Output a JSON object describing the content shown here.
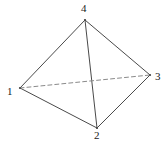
{
  "figure": {
    "kind": "tetrahedron-graph-diagram",
    "background_color": "#ffffff",
    "edge_color": "#4a4a4a",
    "hidden_edge_color": "#8a8a8a",
    "label_color": "#1a1a1a",
    "edge_width": 1,
    "dash_pattern": "4 3",
    "vertices": [
      {
        "id": "1",
        "label": "1",
        "x": 20,
        "y": 88,
        "label_x": 7,
        "label_y": 86
      },
      {
        "id": "2",
        "label": "2",
        "x": 97,
        "y": 128,
        "label_x": 94,
        "label_y": 130
      },
      {
        "id": "3",
        "label": "3",
        "x": 150,
        "y": 75,
        "label_x": 155,
        "label_y": 71
      },
      {
        "id": "4",
        "label": "4",
        "x": 85,
        "y": 20,
        "label_x": 81,
        "label_y": 3
      }
    ],
    "edges": [
      {
        "id": "edge-1-4",
        "from": "1",
        "to": "4",
        "style": "solid",
        "x1": 20,
        "y1": 88,
        "x2": 85,
        "y2": 20
      },
      {
        "id": "edge-3-4",
        "from": "3",
        "to": "4",
        "style": "solid",
        "x1": 150,
        "y1": 75,
        "x2": 85,
        "y2": 20
      },
      {
        "id": "edge-2-4",
        "from": "2",
        "to": "4",
        "style": "solid",
        "x1": 97,
        "y1": 128,
        "x2": 85,
        "y2": 20
      },
      {
        "id": "edge-1-2",
        "from": "1",
        "to": "2",
        "style": "solid",
        "x1": 20,
        "y1": 88,
        "x2": 97,
        "y2": 128
      },
      {
        "id": "edge-2-3",
        "from": "2",
        "to": "3",
        "style": "solid",
        "x1": 97,
        "y1": 128,
        "x2": 150,
        "y2": 75
      },
      {
        "id": "edge-1-3",
        "from": "1",
        "to": "3",
        "style": "dashed",
        "x1": 20,
        "y1": 88,
        "x2": 150,
        "y2": 75
      }
    ]
  }
}
